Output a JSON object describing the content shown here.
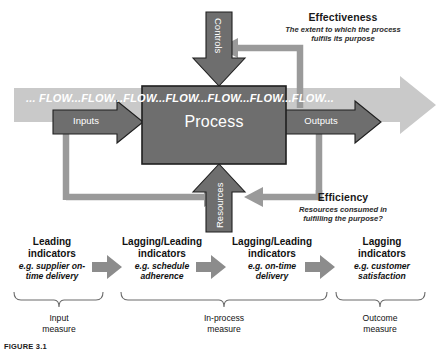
{
  "diagram": {
    "title_caption": "FIGURE 3.1",
    "flow_band_text": "... FLOW...FLOW...FLOW...FLOW...FLOW...FLOW...FLOW...",
    "process_box_label": "Process",
    "inputs_label": "Inputs",
    "outputs_label": "Outputs",
    "controls_label": "Controls",
    "resources_label": "Resources",
    "effectiveness": {
      "heading": "Effectiveness",
      "description_line1": "The extent to which the process",
      "description_line2": "fulfils its purpose"
    },
    "efficiency": {
      "heading": "Efficiency",
      "description_line1": "Resources consumed in",
      "description_line2": "fulfilling the purpose?"
    },
    "indicators": [
      {
        "title_line1": "Leading",
        "title_line2": "indicators",
        "example_line1": "e.g. supplier on-",
        "example_line2": "time delivery"
      },
      {
        "title_line1": "Lagging/Leading",
        "title_line2": "indicators",
        "example_line1": "e.g. schedule",
        "example_line2": "adherence"
      },
      {
        "title_line1": "Lagging/Leading",
        "title_line2": "indicators",
        "example_line1": "e.g. on-time",
        "example_line2": "delivery"
      },
      {
        "title_line1": "Lagging",
        "title_line2": "indicators",
        "example_line1": "e.g. customer",
        "example_line2": "satisfaction"
      }
    ],
    "measures": [
      {
        "line1": "Input",
        "line2": "measure"
      },
      {
        "line1": "In-process",
        "line2": "measure"
      },
      {
        "line1": "Outcome",
        "line2": "measure"
      }
    ],
    "colors": {
      "process_fill": "#6e6e6e",
      "process_stroke": "#1f1f1f",
      "dark_arrow": "#6e6e6e",
      "light_band": "#c9c9c9",
      "mid_gray": "#9a9a9a",
      "feedback_line": "#9a9a9a",
      "indicator_arrow": "#8c8c8c",
      "bracket_line": "#6a6a6a",
      "text_dark": "#1a1a1a"
    }
  }
}
